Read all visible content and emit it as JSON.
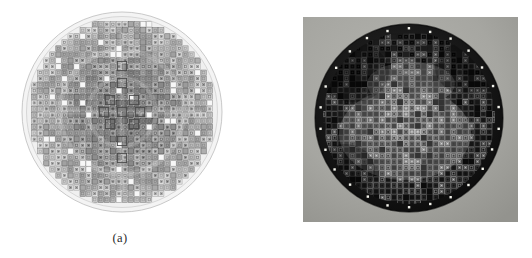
{
  "figure": {
    "kind": "two-panel-figure",
    "background_color": "#ffffff",
    "panels": [
      {
        "id": "a",
        "caption": "(a)",
        "title": "Schematic wafer die map",
        "style": "line-drawing",
        "wafer": {
          "shape": "circle",
          "diameter_px": 200,
          "center_x": 122,
          "center_y": 112,
          "outline_color": "#b9b9b9",
          "fill_color": "#f2f2f2",
          "die_grid_color": "#8e8e8e",
          "die_light_color": "#d8d8d8",
          "grid_columns": 33,
          "grid_rows": 33,
          "die_pitch_px": 6
        }
      },
      {
        "id": "b",
        "caption": "(b)",
        "title": "Photograph of fabricated wafer",
        "style": "grayscale-photograph",
        "photo": {
          "left": 303,
          "top": 17,
          "width": 215,
          "height": 205,
          "background_color": "#a6a6a2",
          "wafer_color": "#121212",
          "die_grid_color": "#c9c9c4",
          "highlight_color": "#efefe8",
          "edge_dot_color": "#f5f5ef",
          "grid_columns": 33,
          "grid_rows": 33
        }
      }
    ]
  },
  "captions": {
    "a": "(a)",
    "b": "(b)"
  },
  "colors": {
    "page_background": "#ffffff",
    "caption_text": "#2b2b2b",
    "schematic_outline": "#b9b9b9",
    "schematic_fill": "#f2f2f2",
    "photo_background": "#a6a6a2",
    "photo_wafer": "#121212"
  }
}
